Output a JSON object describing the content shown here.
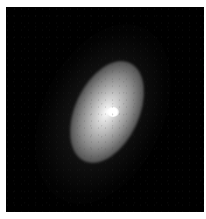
{
  "image": {
    "subject": "elliptical galaxy",
    "description": "Grayscale astronomical image of an elongated galaxy with a bright core, tilted with major axis running from lower-left to upper-right, on a black background inside a white border",
    "colors": {
      "border": "#ffffff",
      "background": "#000000",
      "core": "#ffffff"
    }
  }
}
